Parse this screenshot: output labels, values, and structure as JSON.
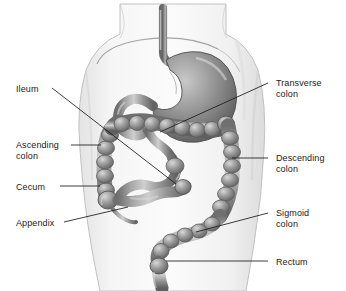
{
  "figure": {
    "view": "anterior view of human torso",
    "style": "grayscale medical illustration",
    "colors": {
      "background": "#ffffff",
      "body_silhouette": "#f2f2f2",
      "body_outline": "#b9b9b9",
      "organ_mid": "#8d8d8d",
      "organ_light": "#d2d2d2",
      "organ_dark": "#5d5d5d",
      "leader_line": "#1a1a1a",
      "label_text": "#1a1a1a"
    }
  },
  "labels": [
    {
      "id": "ileum",
      "text": "Ileum",
      "side": "left",
      "x": 16,
      "y": 84,
      "lines": 1
    },
    {
      "id": "ascending-colon",
      "text": "Ascending\ncolon",
      "side": "left",
      "x": 16,
      "y": 140,
      "lines": 2
    },
    {
      "id": "cecum",
      "text": "Cecum",
      "side": "left",
      "x": 16,
      "y": 182,
      "lines": 1
    },
    {
      "id": "appendix",
      "text": "Appendix",
      "side": "left",
      "x": 16,
      "y": 218,
      "lines": 1
    },
    {
      "id": "transverse-colon",
      "text": "Transverse\ncolon",
      "side": "right",
      "x": 276,
      "y": 78,
      "lines": 2
    },
    {
      "id": "descending-colon",
      "text": "Descending\ncolon",
      "side": "right",
      "x": 276,
      "y": 153,
      "lines": 2
    },
    {
      "id": "sigmoid-colon",
      "text": "Sigmoid\ncolon",
      "side": "right",
      "x": 276,
      "y": 208,
      "lines": 2
    },
    {
      "id": "rectum",
      "text": "Rectum",
      "side": "right",
      "x": 276,
      "y": 257,
      "lines": 1
    }
  ],
  "organs": [
    {
      "id": "esophagus",
      "name": "esophagus"
    },
    {
      "id": "stomach",
      "name": "stomach"
    },
    {
      "id": "duodenum",
      "name": "duodenum"
    },
    {
      "id": "ileum",
      "name": "ileum"
    },
    {
      "id": "cecum",
      "name": "cecum"
    },
    {
      "id": "appendix",
      "name": "appendix"
    },
    {
      "id": "ascending-colon",
      "name": "ascending colon"
    },
    {
      "id": "transverse-colon",
      "name": "transverse colon"
    },
    {
      "id": "descending-colon",
      "name": "descending colon"
    },
    {
      "id": "sigmoid-colon",
      "name": "sigmoid colon"
    },
    {
      "id": "rectum",
      "name": "rectum"
    },
    {
      "id": "diaphragm",
      "name": "diaphragm"
    }
  ]
}
